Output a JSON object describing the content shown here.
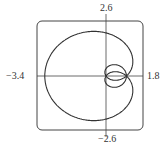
{
  "chart_data": {
    "type": "line",
    "title": "",
    "xlabel": "",
    "ylabel": "",
    "xlim": [
      -3.4,
      1.8
    ],
    "ylim": [
      -2.6,
      2.6
    ],
    "tick_labels": {
      "left": "−3.4",
      "right": "1.8",
      "top": "2.6",
      "bottom": "−2.6"
    },
    "grid": false
  }
}
